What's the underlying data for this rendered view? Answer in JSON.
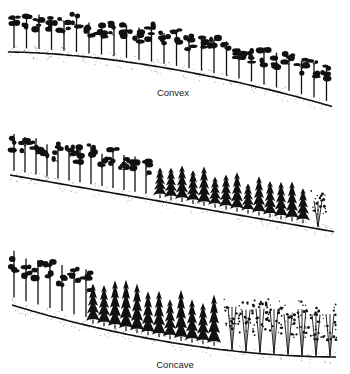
{
  "figure": {
    "panels": [
      {
        "id": "convex",
        "label": "Convex",
        "slope_shape": "convex",
        "vegetation": [
          "deciduous"
        ],
        "tree_count": 26
      },
      {
        "id": "straight",
        "label": "",
        "slope_shape": "straight",
        "vegetation": [
          "deciduous",
          "conifer",
          "broadleaf"
        ],
        "tree_count": 27
      },
      {
        "id": "concave",
        "label": "Concave",
        "slope_shape": "concave",
        "vegetation": [
          "deciduous",
          "conifer",
          "broadleaf"
        ],
        "tree_count": 26
      }
    ],
    "colors": {
      "ink": "#111111",
      "background": "#ffffff",
      "stipple": "#555555"
    }
  }
}
